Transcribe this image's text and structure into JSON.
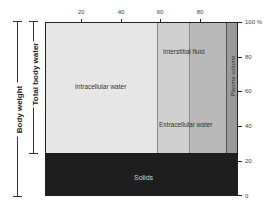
{
  "diagram": {
    "top_axis": {
      "ticks": [
        {
          "label": "20",
          "x": 81
        },
        {
          "label": "40",
          "x": 121
        },
        {
          "label": "60",
          "x": 160
        },
        {
          "label": "80",
          "x": 200
        }
      ]
    },
    "right_axis": {
      "ticks": [
        {
          "label": "100 %",
          "y": 22
        },
        {
          "label": "80",
          "y": 57
        },
        {
          "label": "60",
          "y": 91
        },
        {
          "label": "40",
          "y": 126
        },
        {
          "label": "20",
          "y": 161
        },
        {
          "label": "0",
          "y": 196
        }
      ]
    },
    "compartments": {
      "intracellular": "Intracellular water",
      "interstitial": "Interstitial fluid",
      "extracellular": "Extracellular water",
      "plasma": "Plasma volume",
      "solids": "Solids"
    },
    "brackets": {
      "body_weight": "Body weight",
      "total_body_water": "Total body water"
    },
    "colors": {
      "intracellular": "#e6e6e6",
      "interstitial": "#cfcfcf",
      "extracellular": "#b9b9b9",
      "plasma": "#9a9a9a",
      "solids": "#1e1e1e"
    }
  }
}
